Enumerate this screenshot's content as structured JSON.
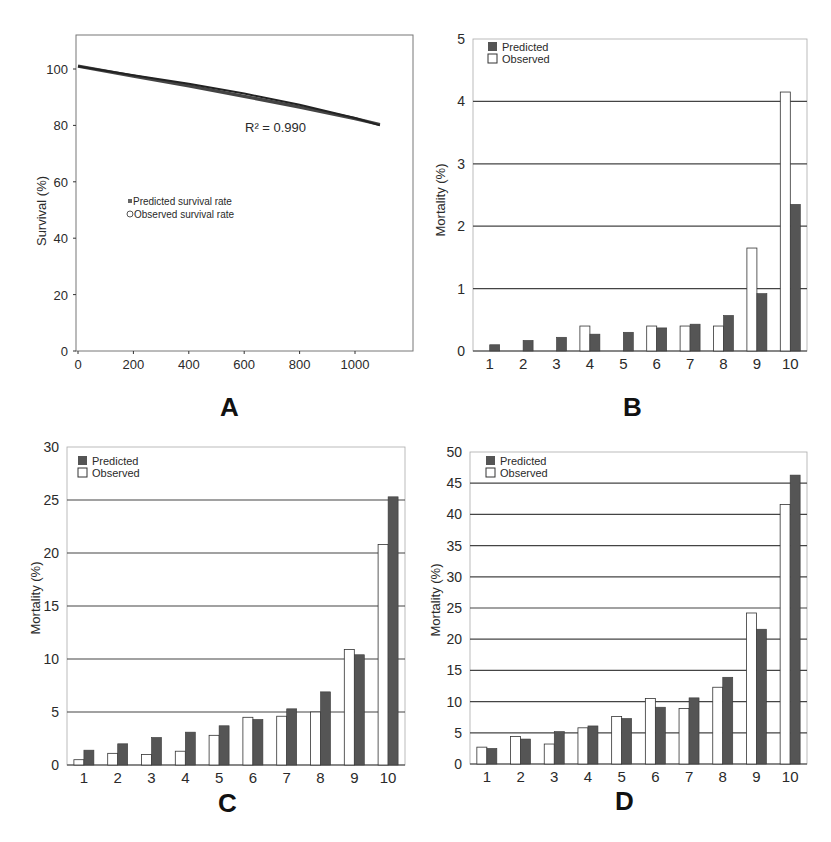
{
  "panels": {
    "A": {
      "label": "A"
    },
    "B": {
      "label": "B"
    },
    "C": {
      "label": "C"
    },
    "D": {
      "label": "D"
    }
  },
  "chart_data": [
    {
      "panel": "A",
      "type": "line",
      "title": "",
      "xlabel": "(days)",
      "ylabel": "Survival  (%)",
      "xlim": [
        0,
        1150
      ],
      "ylim": [
        0,
        110
      ],
      "xticks": [
        0,
        200,
        400,
        600,
        800,
        1000
      ],
      "yticks": [
        0,
        20,
        40,
        60,
        80,
        100
      ],
      "grid": false,
      "annotation": "R² = 0.990",
      "legend": [
        "Predicted survival rate",
        "Observed survival rate"
      ],
      "legend_position": "center-left",
      "series": [
        {
          "name": "Predicted survival rate",
          "x": [
            0,
            200,
            400,
            600,
            800,
            1000,
            1090
          ],
          "y": [
            101,
            97.5,
            94,
            90.3,
            86.5,
            82.4,
            80.3
          ]
        },
        {
          "name": "Observed survival rate",
          "x": [
            0,
            200,
            400,
            600,
            800,
            1000,
            1090
          ],
          "y": [
            101,
            97.8,
            94.8,
            91.3,
            87.3,
            82.6,
            80.0
          ]
        }
      ]
    },
    {
      "panel": "B",
      "type": "bar",
      "title": "",
      "xlabel": "",
      "ylabel": "Mortality (%)",
      "ylim": [
        0,
        5
      ],
      "yticks": [
        0,
        1,
        2,
        3,
        4,
        5
      ],
      "grid": true,
      "legend": [
        "Predicted",
        "Observed"
      ],
      "legend_position": "top-left",
      "categories": [
        "1",
        "2",
        "3",
        "4",
        "5",
        "6",
        "7",
        "8",
        "9",
        "10"
      ],
      "series": [
        {
          "name": "Observed",
          "values": [
            0,
            0,
            0,
            0.4,
            0,
            0.4,
            0.4,
            0.4,
            1.65,
            4.15
          ]
        },
        {
          "name": "Predicted",
          "values": [
            0.1,
            0.17,
            0.22,
            0.27,
            0.3,
            0.37,
            0.43,
            0.57,
            0.92,
            2.35
          ]
        }
      ]
    },
    {
      "panel": "C",
      "type": "bar",
      "title": "",
      "xlabel": "",
      "ylabel": "Mortality (%)",
      "ylim": [
        0,
        30
      ],
      "yticks": [
        0,
        5,
        10,
        15,
        20,
        25,
        30
      ],
      "grid": true,
      "legend": [
        "Predicted",
        "Observed"
      ],
      "legend_position": "top-left",
      "categories": [
        "1",
        "2",
        "3",
        "4",
        "5",
        "6",
        "7",
        "8",
        "9",
        "10"
      ],
      "series": [
        {
          "name": "Observed",
          "values": [
            0.5,
            1.1,
            1.0,
            1.3,
            2.8,
            4.5,
            4.6,
            5.0,
            10.9,
            20.8
          ]
        },
        {
          "name": "Predicted",
          "values": [
            1.4,
            2.0,
            2.6,
            3.1,
            3.7,
            4.3,
            5.3,
            6.9,
            10.4,
            25.3
          ]
        }
      ]
    },
    {
      "panel": "D",
      "type": "bar",
      "title": "",
      "xlabel": "",
      "ylabel": "Mortality (%)",
      "ylim": [
        0,
        50
      ],
      "yticks": [
        0,
        5,
        10,
        15,
        20,
        25,
        30,
        35,
        40,
        45,
        50
      ],
      "grid": true,
      "legend": [
        "Predicted",
        "Observed"
      ],
      "legend_position": "top-left",
      "categories": [
        "1",
        "2",
        "3",
        "4",
        "5",
        "6",
        "7",
        "8",
        "9",
        "10"
      ],
      "series": [
        {
          "name": "Observed",
          "values": [
            2.7,
            4.4,
            3.2,
            5.8,
            7.6,
            10.5,
            8.9,
            12.3,
            24.2,
            41.6
          ]
        },
        {
          "name": "Predicted",
          "values": [
            2.5,
            4.0,
            5.2,
            6.1,
            7.3,
            9.1,
            10.6,
            13.9,
            21.6,
            46.3
          ]
        }
      ]
    }
  ],
  "colors": {
    "predicted": "#555555",
    "observed": "#ffffff",
    "observed_stroke": "#333333",
    "grid": "#444444",
    "axis": "#333333"
  }
}
